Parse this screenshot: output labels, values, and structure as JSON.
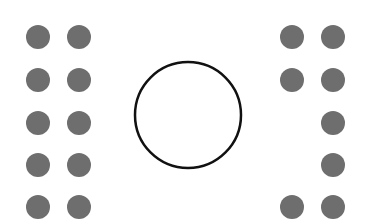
{
  "colors": {
    "background": "#ffffff",
    "dot_fill": "#6e6e6e",
    "circle_stroke": "#111111",
    "circle_fill": "#ffffff"
  },
  "dot_radius": 12,
  "center_circle": {
    "cx": 188,
    "cy": 115,
    "r": 53,
    "stroke_width": 2.5
  },
  "left_grid": {
    "columns_x": [
      38,
      79
    ],
    "rows_y": [
      37,
      80,
      123,
      165,
      207
    ],
    "dots": [
      [
        true,
        true
      ],
      [
        true,
        true
      ],
      [
        true,
        true
      ],
      [
        true,
        true
      ],
      [
        true,
        true
      ]
    ]
  },
  "right_grid": {
    "columns_x": [
      292,
      333
    ],
    "rows_y": [
      37,
      80,
      123,
      165,
      207
    ],
    "dots": [
      [
        true,
        true
      ],
      [
        true,
        true
      ],
      [
        false,
        true
      ],
      [
        false,
        true
      ],
      [
        true,
        true
      ]
    ]
  }
}
